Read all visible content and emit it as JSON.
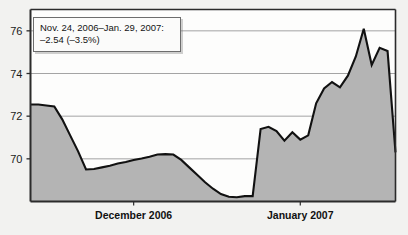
{
  "chart_data": {
    "type": "area",
    "title": "",
    "subtitle": "",
    "xlabel": "",
    "ylabel": "",
    "ylim": [
      68,
      77
    ],
    "xlim": [
      0,
      46
    ],
    "grid": true,
    "legend_position": "none",
    "ytick_labels": [
      "76",
      "74",
      "72",
      "70"
    ],
    "ytick_values": [
      76,
      74,
      72,
      70
    ],
    "xtick_labels": [
      "December 2006",
      "January 2007"
    ],
    "xtick_positions": [
      13,
      34
    ],
    "series": [
      {
        "name": "price",
        "x": [
          0,
          1,
          2,
          3,
          4,
          5,
          6,
          7,
          8,
          9,
          10,
          11,
          12,
          13,
          14,
          15,
          16,
          17,
          18,
          19,
          20,
          21,
          22,
          23,
          24,
          25,
          26,
          27,
          28,
          29,
          30,
          31,
          32,
          33,
          34,
          35,
          36,
          37,
          38,
          39,
          40,
          41,
          42,
          43,
          44,
          45,
          46
        ],
        "values": [
          72.55,
          72.55,
          72.5,
          72.45,
          71.85,
          71.1,
          70.35,
          69.5,
          69.52,
          69.6,
          69.68,
          69.78,
          69.85,
          69.95,
          70.02,
          70.1,
          70.2,
          70.22,
          70.2,
          69.95,
          69.6,
          69.25,
          68.9,
          68.6,
          68.35,
          68.22,
          68.2,
          68.25,
          68.25,
          71.4,
          71.5,
          71.3,
          70.85,
          71.25,
          70.9,
          71.1,
          72.6,
          73.3,
          73.6,
          73.35,
          73.9,
          74.8,
          76.1,
          74.4,
          75.2,
          75.05,
          70.3
        ]
      }
    ],
    "annotation": {
      "line1": "Nov. 24, 2006–Jan. 29, 2007:",
      "line2": "–2.54 (–3.5%)"
    },
    "colors": {
      "area_fill": "#b4b4b4",
      "line": "#111111",
      "gridline": "#9a9a9a",
      "axis": "#2b2b2b",
      "background": "#f2f2f0",
      "tooltip_bg": "#fbfbfa",
      "tooltip_border": "#6d6d6d",
      "text": "#141414"
    }
  }
}
